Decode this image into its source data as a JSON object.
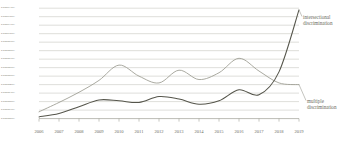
{
  "chart_data": {
    "type": "line",
    "title": "",
    "xlabel": "",
    "ylabel": "",
    "grid": true,
    "legend_position": "right-inline",
    "categories": [
      "2006",
      "2007",
      "2008",
      "2009",
      "2010",
      "2011",
      "2012",
      "2013",
      "2014",
      "2015",
      "2016",
      "2017",
      "2018",
      "2019"
    ],
    "y_ticks": [
      "0.0000130%",
      "0.0000120%",
      "0.0000110%",
      "0.0000100%",
      "0.0000090%",
      "0.0000080%",
      "0.0000070%",
      "0.0000060%",
      "0.0000050%",
      "0.0000040%",
      "0.0000030%",
      "0.0000020%",
      "0.0000010%",
      "0.0000000%"
    ],
    "ylim": [
      0.0,
      1.3e-05
    ],
    "series": [
      {
        "name": "intersectional discrimination",
        "color": "#5a5a50",
        "values": [
          2e-07,
          6e-07,
          1.4e-06,
          2.2e-06,
          2.1e-06,
          1.9e-06,
          2.6e-06,
          2.3e-06,
          1.7e-06,
          2.1e-06,
          3.4e-06,
          2.8e-06,
          5.5e-06,
          1.28e-05
        ]
      },
      {
        "name": "multiple discrimination",
        "color": "#9b9b90",
        "values": [
          8e-07,
          1.9e-06,
          3.1e-06,
          4.5e-06,
          6.3e-06,
          5e-06,
          4.2e-06,
          5.7e-06,
          4.6e-06,
          5.4e-06,
          7.1e-06,
          5.6e-06,
          4.2e-06,
          4e-06
        ]
      }
    ]
  },
  "labels": {
    "intersectional_line1": "intersectional",
    "intersectional_line2": "discrimination",
    "multiple_line1": "multiple",
    "multiple_line2": "discrimination"
  }
}
